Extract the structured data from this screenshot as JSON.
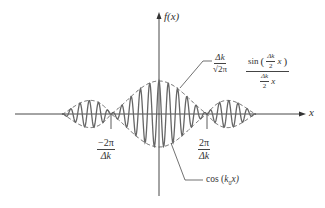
{
  "diagram": {
    "title": "",
    "axes": {
      "y_label": "f(x)",
      "x_label": "x"
    },
    "ticks": {
      "left": {
        "num": "−2π",
        "den": "Δk"
      },
      "right": {
        "num": "2π",
        "den": "Δk"
      }
    },
    "annotations": {
      "envelope_coeff": {
        "num": "Δk",
        "den": "√2π"
      },
      "envelope_fn": {
        "num": "sin (Δk/2 x)",
        "num_prefix": "sin",
        "inner_num": "Δk",
        "inner_den": "2",
        "inner_var": "x",
        "den_num": "Δk",
        "den_den": "2",
        "den_var": "x"
      },
      "carrier": "cos (k₀x)",
      "carrier_prefix": "cos (",
      "carrier_k": "k",
      "carrier_sub": "0",
      "carrier_suffix": "x)"
    },
    "colors": {
      "curve": "#555555",
      "envelope": "#555555",
      "axis": "#333333"
    }
  }
}
